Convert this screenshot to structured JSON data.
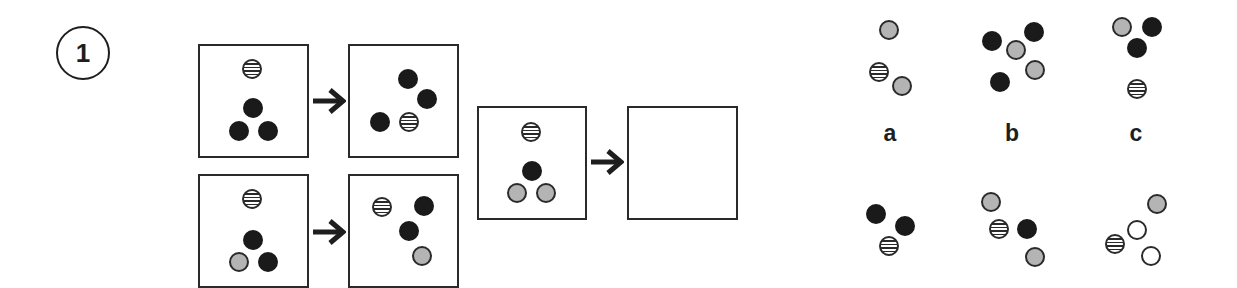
{
  "question": {
    "number": "1"
  },
  "colors": {
    "black": "#1a1a1a",
    "gray": "#b4b4b4",
    "outline": "#2a2a2a",
    "white": "#ffffff"
  },
  "examples": [
    {
      "before": {
        "box": {
          "x": 198,
          "y": 44,
          "w": 111,
          "h": 114
        },
        "dots": [
          {
            "type": "striped",
            "x": 252,
            "y": 69
          },
          {
            "type": "black",
            "x": 253,
            "y": 108
          },
          {
            "type": "black",
            "x": 239,
            "y": 131
          },
          {
            "type": "black",
            "x": 268,
            "y": 131
          }
        ]
      },
      "arrow": {
        "x": 312,
        "y": 88
      },
      "after": {
        "box": {
          "x": 348,
          "y": 44,
          "w": 111,
          "h": 114
        },
        "dots": [
          {
            "type": "black",
            "x": 408,
            "y": 79
          },
          {
            "type": "black",
            "x": 427,
            "y": 99
          },
          {
            "type": "black",
            "x": 380,
            "y": 122
          },
          {
            "type": "striped",
            "x": 409,
            "y": 122
          }
        ]
      }
    },
    {
      "before": {
        "box": {
          "x": 198,
          "y": 174,
          "w": 111,
          "h": 114
        },
        "dots": [
          {
            "type": "striped",
            "x": 252,
            "y": 199
          },
          {
            "type": "black",
            "x": 253,
            "y": 240
          },
          {
            "type": "gray",
            "x": 239,
            "y": 262
          },
          {
            "type": "black",
            "x": 268,
            "y": 262
          }
        ]
      },
      "arrow": {
        "x": 312,
        "y": 219
      },
      "after": {
        "box": {
          "x": 348,
          "y": 174,
          "w": 111,
          "h": 114
        },
        "dots": [
          {
            "type": "striped",
            "x": 382,
            "y": 207
          },
          {
            "type": "black",
            "x": 424,
            "y": 206
          },
          {
            "type": "black",
            "x": 409,
            "y": 231
          },
          {
            "type": "gray",
            "x": 422,
            "y": 256
          }
        ]
      }
    }
  ],
  "problem": {
    "given": {
      "box": {
        "x": 477,
        "y": 106,
        "w": 110,
        "h": 114
      },
      "dots": [
        {
          "type": "striped",
          "x": 531,
          "y": 132
        },
        {
          "type": "black",
          "x": 532,
          "y": 171
        },
        {
          "type": "gray",
          "x": 517,
          "y": 193
        },
        {
          "type": "gray",
          "x": 546,
          "y": 193
        }
      ]
    },
    "arrow": {
      "x": 590,
      "y": 149
    },
    "answer_box": {
      "x": 627,
      "y": 106,
      "w": 111,
      "h": 114
    }
  },
  "options": [
    {
      "label": "a",
      "label_pos": {
        "x": 890,
        "y": 122
      },
      "dots": [
        {
          "type": "gray",
          "x": 889,
          "y": 30
        },
        {
          "type": "striped",
          "x": 879,
          "y": 72
        },
        {
          "type": "gray",
          "x": 902,
          "y": 86
        }
      ]
    },
    {
      "label": "b",
      "label_pos": {
        "x": 1012,
        "y": 122
      },
      "dots": [
        {
          "type": "black",
          "x": 992,
          "y": 41
        },
        {
          "type": "gray",
          "x": 1016,
          "y": 50
        },
        {
          "type": "black",
          "x": 1034,
          "y": 32
        },
        {
          "type": "gray",
          "x": 1035,
          "y": 70
        },
        {
          "type": "black",
          "x": 1000,
          "y": 82
        }
      ]
    },
    {
      "label": "c",
      "label_pos": {
        "x": 1136,
        "y": 122
      },
      "dots": [
        {
          "type": "gray",
          "x": 1122,
          "y": 27
        },
        {
          "type": "black",
          "x": 1152,
          "y": 27
        },
        {
          "type": "black",
          "x": 1137,
          "y": 48
        },
        {
          "type": "striped",
          "x": 1137,
          "y": 89
        }
      ]
    },
    {
      "label": "",
      "dots": [
        {
          "type": "black",
          "x": 876,
          "y": 214
        },
        {
          "type": "black",
          "x": 905,
          "y": 226
        },
        {
          "type": "striped",
          "x": 889,
          "y": 246
        }
      ]
    },
    {
      "label": "",
      "dots": [
        {
          "type": "gray",
          "x": 991,
          "y": 202
        },
        {
          "type": "striped",
          "x": 999,
          "y": 229
        },
        {
          "type": "black",
          "x": 1027,
          "y": 229
        },
        {
          "type": "gray",
          "x": 1035,
          "y": 257
        }
      ]
    },
    {
      "label": "",
      "dots": [
        {
          "type": "gray",
          "x": 1157,
          "y": 204
        },
        {
          "type": "white",
          "x": 1137,
          "y": 230
        },
        {
          "type": "striped",
          "x": 1115,
          "y": 244
        },
        {
          "type": "white",
          "x": 1151,
          "y": 256
        }
      ]
    }
  ]
}
